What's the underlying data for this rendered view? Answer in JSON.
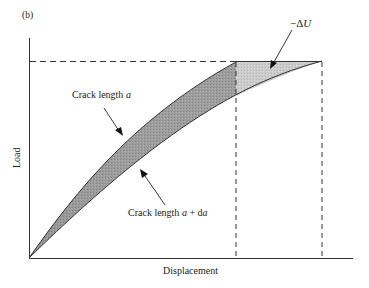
{
  "figure": {
    "panel_label": "(b)",
    "xlabel": "Displacement",
    "ylabel": "Load",
    "annotations": {
      "crack_a_prefix": "Crack length ",
      "crack_a_var": "a",
      "crack_ada_prefix": "Crack length ",
      "crack_ada_var": "a",
      "crack_ada_plus": " + d",
      "crack_ada_var2": "a",
      "energy_release_minus": "−Δ",
      "energy_release_var": "U"
    },
    "colors": {
      "axis": "#333333",
      "dark_fill": "#8c8c8c",
      "light_fill": "#c4c4c4",
      "dashed": "#333333"
    }
  }
}
